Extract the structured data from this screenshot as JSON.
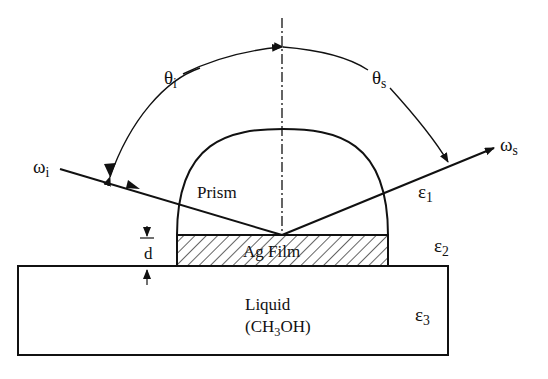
{
  "figure": {
    "type": "schematic"
  },
  "labels": {
    "theta_i": {
      "base": "θ",
      "sub": "i"
    },
    "theta_s": {
      "base": "θ",
      "sub": "s"
    },
    "omega_i": {
      "base": "ω",
      "sub": "i"
    },
    "omega_s": {
      "base": "ω",
      "sub": "s"
    },
    "eps1": {
      "base": "ε",
      "sub": "1"
    },
    "eps2": {
      "base": "ε",
      "sub": "2"
    },
    "eps3": {
      "base": "ε",
      "sub": "3"
    },
    "prism": "Prism",
    "film": "Ag Film",
    "thickness": "d",
    "liquid": "Liquid",
    "liquid_formula": {
      "pre": "(CH",
      "sub": "3",
      "post": "OH)"
    }
  },
  "colors": {
    "ink": "#111111",
    "background": "#ffffff"
  }
}
